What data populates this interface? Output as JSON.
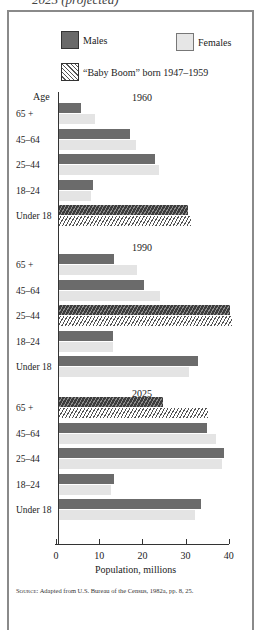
{
  "caption_top": "2025 (projected)",
  "legend": {
    "males": "Males",
    "females": "Females",
    "baby_boom": "“Baby Boom” born 1947–1959"
  },
  "age_header": "Age",
  "x_axis": {
    "label": "Population, millions",
    "ticks": [
      "0",
      "10",
      "20",
      "30",
      "40"
    ]
  },
  "source": {
    "prefix": "Source:",
    "text": "Adapted from U.S. Bureau of the Census, 1982a, pp. 8, 25."
  },
  "colors": {
    "male": "#6b6b6b",
    "female": "#e4e4e4",
    "frame": "#8a8a8a"
  },
  "chart_data": {
    "type": "bar",
    "orientation": "horizontal",
    "title": "",
    "xlabel": "Population, millions",
    "ylabel": "Age",
    "xlim": [
      0,
      40
    ],
    "xticks": [
      0,
      10,
      20,
      30,
      40
    ],
    "grid": false,
    "legend": [
      "Males",
      "Females",
      "“Baby Boom” born 1947–1959"
    ],
    "legend_position": "top",
    "categories": [
      "65 +",
      "45–64",
      "25–44",
      "18–24",
      "Under 18"
    ],
    "panels": [
      {
        "year": "1960",
        "series": [
          {
            "name": "Males",
            "values": [
              5.1,
              16.7,
              22.7,
              8.0,
              30.5
            ]
          },
          {
            "name": "Females",
            "values": [
              8.6,
              18.3,
              23.7,
              7.5,
              31.2
            ]
          }
        ],
        "baby_boom_category": "Under 18"
      },
      {
        "year": "1990",
        "series": [
          {
            "name": "Males",
            "values": [
              12.9,
              20.0,
              40.4,
              12.7,
              32.8
            ]
          },
          {
            "name": "Females",
            "values": [
              18.5,
              24.0,
              41.0,
              12.7,
              30.7
            ]
          }
        ],
        "baby_boom_category": "25–44"
      },
      {
        "year": "2025",
        "series": [
          {
            "name": "Males",
            "values": [
              24.7,
              35.1,
              39.0,
              12.9,
              33.5
            ]
          },
          {
            "name": "Females",
            "values": [
              35.3,
              37.2,
              38.6,
              12.2,
              32.3
            ]
          }
        ],
        "baby_boom_category": "65 +"
      }
    ]
  }
}
